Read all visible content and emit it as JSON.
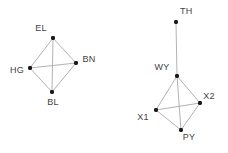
{
  "figure": {
    "background_color": "#ffffff",
    "width": 228,
    "height": 153,
    "edge_color": "#b3b3b3",
    "node_color": "#1a1a1a",
    "label_color": "#434343"
  },
  "chart_data": {
    "type": "network",
    "title": "",
    "xlabel": "",
    "ylabel": "",
    "grid": false,
    "legend": "none",
    "xlim": [
      0,
      228
    ],
    "ylim": [
      0,
      153
    ],
    "graphs": [
      {
        "name": "left-graph",
        "nodes": [
          {
            "id": "EL",
            "label": "EL",
            "x": 53,
            "y": 38,
            "label_x": 41,
            "label_y": 29,
            "label_anchor": "middle"
          },
          {
            "id": "HG",
            "label": "HG",
            "x": 30,
            "y": 68,
            "label_x": 17,
            "label_y": 71,
            "label_anchor": "middle"
          },
          {
            "id": "BN",
            "label": "BN",
            "x": 76,
            "y": 63,
            "label_x": 89,
            "label_y": 60,
            "label_anchor": "middle"
          },
          {
            "id": "BL",
            "label": "BL",
            "x": 52,
            "y": 92,
            "label_x": 53,
            "label_y": 103,
            "label_anchor": "middle"
          }
        ],
        "edges": [
          {
            "source": "EL",
            "target": "HG"
          },
          {
            "source": "EL",
            "target": "BN"
          },
          {
            "source": "EL",
            "target": "BL"
          },
          {
            "source": "HG",
            "target": "BN"
          },
          {
            "source": "HG",
            "target": "BL"
          },
          {
            "source": "BN",
            "target": "BL"
          }
        ]
      },
      {
        "name": "right-graph",
        "nodes": [
          {
            "id": "TH",
            "label": "TH",
            "x": 176,
            "y": 22,
            "label_x": 180,
            "label_y": 12,
            "label_anchor": "start"
          },
          {
            "id": "WY",
            "label": "WY",
            "x": 177,
            "y": 76,
            "label_x": 162,
            "label_y": 68,
            "label_anchor": "middle"
          },
          {
            "id": "X2",
            "label": "X2",
            "x": 200,
            "y": 103,
            "label_x": 209,
            "label_y": 97,
            "label_anchor": "middle"
          },
          {
            "id": "X1",
            "label": "X1",
            "x": 156,
            "y": 110,
            "label_x": 143,
            "label_y": 118,
            "label_anchor": "middle"
          },
          {
            "id": "PY",
            "label": "PY",
            "x": 181,
            "y": 130,
            "label_x": 189,
            "label_y": 138,
            "label_anchor": "middle"
          }
        ],
        "edges": [
          {
            "source": "TH",
            "target": "WY"
          },
          {
            "source": "WY",
            "target": "X1"
          },
          {
            "source": "WY",
            "target": "X2"
          },
          {
            "source": "WY",
            "target": "PY"
          },
          {
            "source": "X1",
            "target": "X2"
          },
          {
            "source": "X1",
            "target": "PY"
          },
          {
            "source": "X2",
            "target": "PY"
          }
        ]
      }
    ]
  }
}
